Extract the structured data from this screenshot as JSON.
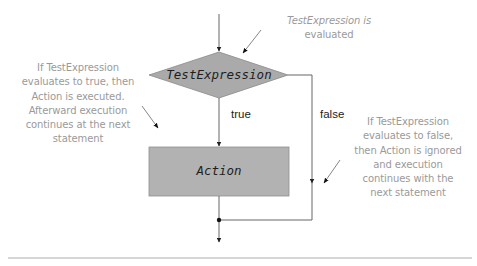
{
  "diagram": {
    "type": "flowchart",
    "decision": {
      "label": "TestExpression",
      "fill": "#aaaaaa"
    },
    "action": {
      "label": "Action",
      "fill": "#b2b2b2"
    },
    "branches": {
      "true_label": "true",
      "false_label": "false"
    },
    "notes": {
      "top": {
        "lines": [
          "TestExpression is",
          "evaluated"
        ]
      },
      "left": {
        "lines": [
          "If TestExpression",
          "evaluates to true, then",
          "Action is executed.",
          "Afterward  execution",
          "continues at the next",
          "statement"
        ]
      },
      "right": {
        "lines": [
          "If TestExpression",
          "evaluates to false,",
          "then Action is ignored",
          "and execution",
          "continues with the",
          "next statement"
        ]
      }
    },
    "colors": {
      "line": "#666666",
      "note_text": "#9a9a9a",
      "rule": "#c8c8c8"
    }
  }
}
